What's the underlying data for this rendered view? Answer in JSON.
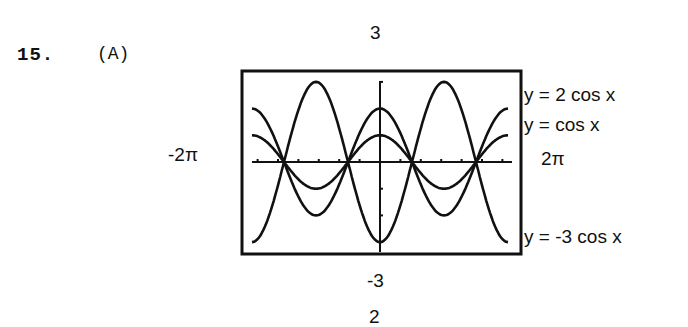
{
  "problem": {
    "number": "15.",
    "part": "(A)"
  },
  "window": {
    "ymax_label": "3",
    "ymin_label": "-3",
    "xmin_label": "-2π",
    "xmax_label": "2π",
    "bottom_stub": "2"
  },
  "curve_labels": [
    "y = 2 cos x",
    "y = cos x",
    "y = -3 cos x"
  ],
  "chart_data": {
    "type": "line",
    "title": "",
    "xlabel": "",
    "ylabel": "",
    "xlim": [
      -6.2832,
      6.2832
    ],
    "ylim": [
      -3,
      3
    ],
    "x_tick_labels": [
      "-2π",
      "2π"
    ],
    "y_tick_labels": [
      "-3",
      "3"
    ],
    "grid": false,
    "series": [
      {
        "name": "y = 2 cos x",
        "function": "2*cos(x)",
        "amplitude": 2
      },
      {
        "name": "y = cos x",
        "function": "cos(x)",
        "amplitude": 1
      },
      {
        "name": "y = -3 cos x",
        "function": "-3*cos(x)",
        "amplitude": -3
      }
    ]
  }
}
